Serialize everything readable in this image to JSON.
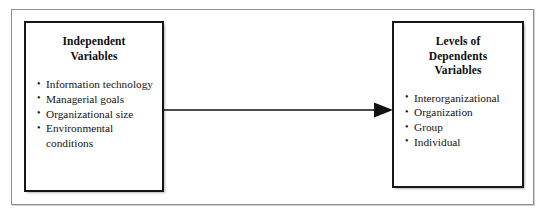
{
  "diagram": {
    "left_box": {
      "heading_lines": [
        "Independent",
        "Variables"
      ],
      "items": [
        "Information technology",
        "Managerial goals",
        "Organizational size",
        "Environmental conditions"
      ]
    },
    "right_box": {
      "heading_lines": [
        "Levels of",
        "Dependents",
        "Variables"
      ],
      "items": [
        "Interorganizational",
        "Organization",
        "Group",
        "Individual"
      ]
    },
    "connector": {
      "type": "arrow",
      "direction": "left-to-right",
      "from": "Independent Variables",
      "to": "Levels of Dependents Variables",
      "label": ""
    },
    "colors": {
      "box_border": "#161616",
      "frame_border": "#8e8e8e",
      "text": "#141414",
      "arrow": "#111111",
      "background": "#ffffff"
    }
  }
}
